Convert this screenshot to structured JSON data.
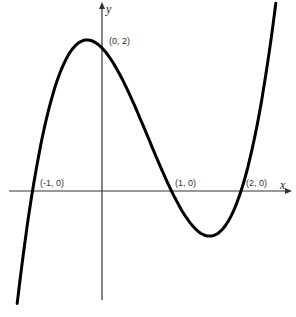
{
  "chart_data": {
    "type": "line",
    "title": "",
    "xlabel": "x",
    "ylabel": "y",
    "function": "f(x) = (x+1)(x-1)(x-2) = x^3 - 2x^2 - x + 2",
    "series": [
      {
        "name": "cubic",
        "color": "#000000",
        "x": [
          -1.3,
          -1,
          -0.5,
          -0.215,
          0,
          0.5,
          1,
          1.5,
          1.55,
          2,
          2.3,
          2.6
        ],
        "values": [
          -1.417,
          0,
          1.875,
          2.113,
          2,
          1.125,
          0,
          -0.625,
          -0.631,
          0,
          1.183,
          3.136
        ]
      }
    ],
    "annotations": [
      {
        "label": "(-1, 0)",
        "x": -1,
        "y": 0
      },
      {
        "label": "(0, 2)",
        "x": 0,
        "y": 2
      },
      {
        "label": "(1, 0)",
        "x": 1,
        "y": 0
      },
      {
        "label": "(2, 0)",
        "x": 2,
        "y": 0
      }
    ],
    "xlim": [
      -1.35,
      2.7
    ],
    "ylim": [
      -1.5,
      2.7
    ],
    "grid": false,
    "legend": null
  },
  "labels": {
    "x_axis": "x",
    "y_axis": "y",
    "p1": "(-1, 0)",
    "p2": "(0, 2)",
    "p3": "(1, 0)",
    "p4": "(2, 0)"
  }
}
